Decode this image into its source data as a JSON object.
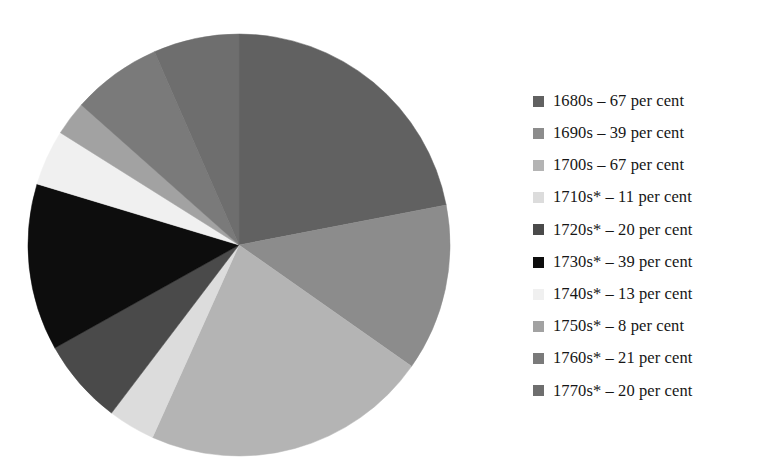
{
  "figure": {
    "background_color": "#ffffff",
    "text_color": "#161616"
  },
  "chart_data": {
    "type": "pie",
    "title": "",
    "subtitle": "",
    "xlabel": "",
    "ylabel": "",
    "grid": false,
    "legend_position": "right",
    "unit": "per cent",
    "start_angle_deg": 0,
    "direction": "clockwise",
    "total": 305,
    "categories": [
      "1680s",
      "1690s",
      "1700s",
      "1710s*",
      "1720s*",
      "1730s*",
      "1740s*",
      "1750s*",
      "1760s*",
      "1770s*"
    ],
    "values": [
      67,
      39,
      67,
      11,
      20,
      39,
      13,
      8,
      21,
      20
    ],
    "colors": [
      "#616161",
      "#8c8c8c",
      "#b4b4b4",
      "#dcdcdc",
      "#4a4a4a",
      "#0d0d0d",
      "#f0f0f0",
      "#a2a2a2",
      "#7a7a7a",
      "#6e6e6e"
    ],
    "slices": [
      {
        "label": "1680s",
        "value": 67,
        "unit": "per cent",
        "color": "#616161",
        "start_deg": 0.0,
        "end_deg": 79.08,
        "legend_text": "1680s – 67 per cent"
      },
      {
        "label": "1690s",
        "value": 39,
        "unit": "per cent",
        "color": "#8c8c8c",
        "start_deg": 79.08,
        "end_deg": 125.11,
        "legend_text": "1690s – 39 per cent"
      },
      {
        "label": "1700s",
        "value": 67,
        "unit": "per cent",
        "color": "#b4b4b4",
        "start_deg": 125.11,
        "end_deg": 204.2,
        "legend_text": "1700s – 67 per cent"
      },
      {
        "label": "1710s*",
        "value": 11,
        "unit": "per cent",
        "color": "#dcdcdc",
        "start_deg": 204.2,
        "end_deg": 217.18,
        "legend_text": "1710s* – 11 per cent"
      },
      {
        "label": "1720s*",
        "value": 20,
        "unit": "per cent",
        "color": "#4a4a4a",
        "start_deg": 217.18,
        "end_deg": 240.79,
        "legend_text": "1720s* – 20 per cent"
      },
      {
        "label": "1730s*",
        "value": 39,
        "unit": "per cent",
        "color": "#0d0d0d",
        "start_deg": 240.79,
        "end_deg": 286.82,
        "legend_text": "1730s* – 39 per cent"
      },
      {
        "label": "1740s*",
        "value": 13,
        "unit": "per cent",
        "color": "#f0f0f0",
        "start_deg": 286.82,
        "end_deg": 302.16,
        "legend_text": "1740s* – 13 per cent"
      },
      {
        "label": "1750s*",
        "value": 8,
        "unit": "per cent",
        "color": "#a2a2a2",
        "start_deg": 302.16,
        "end_deg": 311.61,
        "legend_text": "1750s* – 8 per cent"
      },
      {
        "label": "1760s*",
        "value": 21,
        "unit": "per cent",
        "color": "#7a7a7a",
        "start_deg": 311.61,
        "end_deg": 336.39,
        "legend_text": "1760s* – 21 per cent"
      },
      {
        "label": "1770s*",
        "value": 20,
        "unit": "per cent",
        "color": "#6e6e6e",
        "start_deg": 336.39,
        "end_deg": 360.0,
        "legend_text": "1770s* – 20 per cent"
      }
    ]
  },
  "legend": {
    "items": [
      {
        "text": "1680s – 67 per cent",
        "color": "#616161"
      },
      {
        "text": "1690s – 39 per cent",
        "color": "#8c8c8c"
      },
      {
        "text": "1700s – 67 per cent",
        "color": "#b4b4b4"
      },
      {
        "text": "1710s* – 11 per cent",
        "color": "#dcdcdc"
      },
      {
        "text": "1720s* – 20 per cent",
        "color": "#4a4a4a"
      },
      {
        "text": "1730s* – 39 per cent",
        "color": "#0d0d0d"
      },
      {
        "text": "1740s* – 13 per cent",
        "color": "#f0f0f0"
      },
      {
        "text": "1750s* – 8 per cent",
        "color": "#a2a2a2"
      },
      {
        "text": "1760s* – 21 per cent",
        "color": "#7a7a7a"
      },
      {
        "text": "1770s* – 20 per cent",
        "color": "#6e6e6e"
      }
    ]
  }
}
